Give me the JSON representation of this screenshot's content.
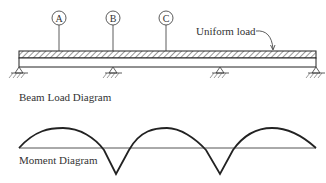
{
  "beam_diagram": {
    "title": "Beam Load Diagram",
    "load_label": "Uniform load",
    "markers": [
      {
        "id": "A",
        "label": "A",
        "x": 59
      },
      {
        "id": "B",
        "label": "B",
        "x": 113
      },
      {
        "id": "C",
        "label": "C",
        "x": 166
      }
    ],
    "supports_x": [
      19,
      113,
      220,
      316
    ]
  },
  "moment_diagram": {
    "title": "Moment Diagram",
    "baseline_y": 148,
    "spans": 3
  },
  "colors": {
    "line": "#222222",
    "baseline": "#555555",
    "text": "#333333",
    "hatch": "#444444"
  }
}
